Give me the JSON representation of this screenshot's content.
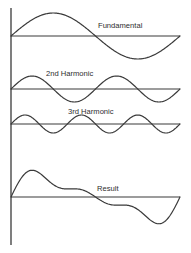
{
  "figure": {
    "background_color": "#ffffff",
    "stroke_color": "#3a3a3a",
    "text_color": "#2e2e2e",
    "axis": {
      "name": "vertical-axis",
      "x": 11,
      "y_top": 8,
      "y_bottom": 245
    }
  },
  "chart_data": {
    "type": "line",
    "xlabel": "",
    "ylabel": "",
    "grid": false,
    "legend_position": "inline-annotation",
    "x_range": [
      0,
      1
    ],
    "samples": 201,
    "panels": [
      {
        "label": "Fundamental",
        "harmonic": 1,
        "cycles": 1,
        "amplitude": 1.0,
        "phase": 0,
        "baseline_y": 36,
        "pixel_amplitude": 23,
        "x_start": 11,
        "x_end": 180,
        "label_x": 98,
        "label_y": 28
      },
      {
        "label": "2nd Harmonic",
        "harmonic": 2,
        "cycles": 2,
        "amplitude": 0.5,
        "phase": 0,
        "baseline_y": 89,
        "pixel_amplitude": 13,
        "x_start": 11,
        "x_end": 180,
        "label_x": 46,
        "label_y": 76
      },
      {
        "label": "3rd Harmonic",
        "harmonic": 3,
        "cycles": 3,
        "amplitude": 0.33,
        "phase": 0,
        "baseline_y": 124,
        "pixel_amplitude": 9,
        "x_start": 11,
        "x_end": 180,
        "label_x": 68,
        "label_y": 114
      },
      {
        "label": "Result",
        "harmonic": 0,
        "cycles": 1,
        "amplitude": 1.0,
        "phase": 0,
        "baseline_y": 197,
        "pixel_amplitude": 34,
        "x_start": 11,
        "x_end": 180,
        "label_x": 97,
        "label_y": 191,
        "is_sum": true,
        "sum_of": [
          1,
          2,
          3
        ]
      }
    ]
  }
}
